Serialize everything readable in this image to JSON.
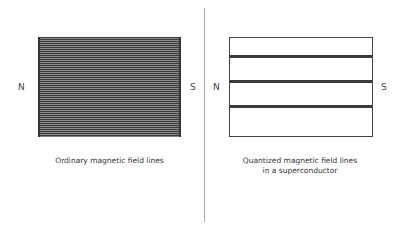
{
  "left_panel": {
    "north_label": "N",
    "south_label": "S",
    "caption": "Ordinary magnetic field lines"
  },
  "right_panel": {
    "north_label": "N",
    "south_label": "S",
    "caption_line1": "Quantized magnetic field lines",
    "caption_line2": "in a superconductor",
    "quantized_line_count": 3
  },
  "colors": {
    "line": "#3a3a3a",
    "divider": "#aaaaaa",
    "background": "#ffffff"
  }
}
